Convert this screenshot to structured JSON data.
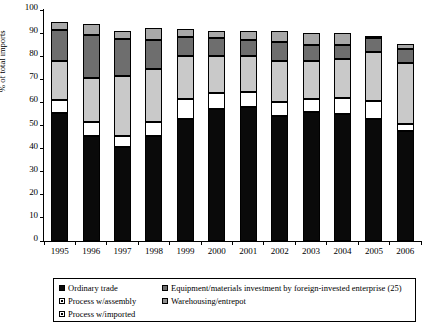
{
  "chart_data": {
    "type": "bar",
    "subtype": "stacked-bar",
    "title": "",
    "xlabel": "",
    "ylabel": "% of total imports",
    "ylim": [
      0,
      100
    ],
    "ytick_step": 10,
    "yticks": [
      0,
      10,
      20,
      30,
      40,
      50,
      60,
      70,
      80,
      90,
      100
    ],
    "grid": false,
    "legend_position": "bottom",
    "categories": [
      "1995",
      "1996",
      "1997",
      "1998",
      "1999",
      "2000",
      "2001",
      "2002",
      "2003",
      "2004",
      "2005",
      "2006"
    ],
    "series": [
      {
        "name": "Ordinary trade",
        "key": "ordinary",
        "color": "#0a0a0a",
        "values": [
          55.5,
          45.5,
          40.8,
          45.5,
          52.8,
          57.0,
          58.0,
          54.0,
          56.0,
          55.0,
          53.0,
          47.5
        ]
      },
      {
        "name": "Process w/assembly",
        "key": "assembly",
        "color": "#ffffff",
        "values": [
          5.5,
          6.2,
          4.7,
          6.0,
          8.7,
          7.0,
          6.5,
          6.0,
          5.5,
          7.0,
          7.5,
          3.0
        ]
      },
      {
        "name": "Process w/imported",
        "key": "imported",
        "color": "#c9c9c9",
        "values": [
          17.0,
          18.8,
          25.8,
          23.0,
          18.5,
          16.0,
          15.5,
          18.0,
          16.5,
          17.0,
          21.5,
          26.5
        ]
      },
      {
        "name": "Equipment/materials investment by foreign-invested enterprise (25)",
        "key": "equipment",
        "color": "#6e6e6e",
        "values": [
          13.5,
          18.5,
          16.2,
          12.5,
          8.5,
          8.0,
          7.0,
          8.0,
          7.0,
          6.0,
          6.0,
          6.0
        ]
      },
      {
        "name": "Warehousing/entrepot",
        "key": "warehousing",
        "color": "#a8a8a8",
        "values": [
          3.5,
          5.0,
          3.5,
          5.0,
          3.5,
          3.0,
          4.0,
          5.0,
          5.0,
          5.0,
          0.5,
          2.5
        ]
      }
    ],
    "totals": [
      95.0,
      94.0,
      91.0,
      92.0,
      92.0,
      91.0,
      91.0,
      91.0,
      90.0,
      90.0,
      88.5,
      85.5
    ]
  },
  "axis": {
    "y_label": "% of total imports",
    "y_tick_labels": [
      "0",
      "10",
      "20",
      "30",
      "40",
      "50",
      "60",
      "70",
      "80",
      "90",
      "100"
    ],
    "x_tick_labels": [
      "1995",
      "1996",
      "1997",
      "1998",
      "1999",
      "2000",
      "2001",
      "2002",
      "2003",
      "2004",
      "2005",
      "2006"
    ]
  },
  "legend": {
    "items": [
      {
        "label": "Ordinary trade",
        "swatch": "ordinary-swatch"
      },
      {
        "label": "Equipment/materials investment by foreign-invested enterprise (25)",
        "swatch": "equipment-swatch"
      },
      {
        "label": "Process w/assembly",
        "swatch": "assembly-swatch"
      },
      {
        "label": "Warehousing/entrepot",
        "swatch": "warehousing-swatch"
      },
      {
        "label": "Process w/imported",
        "swatch": "imported-swatch"
      }
    ]
  }
}
